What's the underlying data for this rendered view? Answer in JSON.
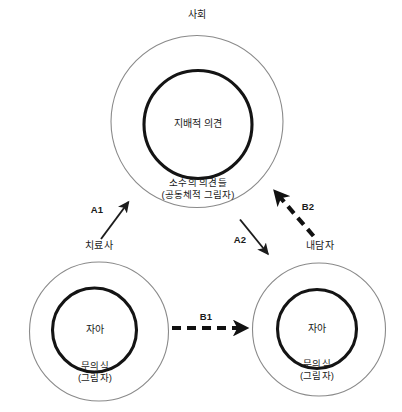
{
  "diagram": {
    "title_visible": false,
    "colors": {
      "background": "#ffffff",
      "outer_circle_stroke": "#8a8a8a",
      "inner_circle_stroke": "#141414",
      "arrow_stroke": "#1a1a1a",
      "text": "#1a1a1a"
    },
    "nodes": [
      {
        "id": "society",
        "external_label": "사회",
        "inner_label": "지배적 의견",
        "ring_label_line1": "소수의 의견들",
        "ring_label_line2": "(공동체적 그림자)"
      },
      {
        "id": "therapist",
        "external_label": "치료사",
        "inner_label": "자아",
        "ring_label_line1": "무의식",
        "ring_label_line2": "(그림자)"
      },
      {
        "id": "client",
        "external_label": "내담자",
        "inner_label": "자아",
        "ring_label_line1": "무의식",
        "ring_label_line2": "(그림자)"
      }
    ],
    "arrows": [
      {
        "id": "a1",
        "label": "A1",
        "style": "solid-thin",
        "from": "therapist",
        "to": "society"
      },
      {
        "id": "a2",
        "label": "A2",
        "style": "solid-thin",
        "from": "society",
        "to": "client"
      },
      {
        "id": "b1",
        "label": "B1",
        "style": "dashed-thick",
        "from": "therapist",
        "to": "client"
      },
      {
        "id": "b2",
        "label": "B2",
        "style": "dashed-thick",
        "from": "client",
        "to": "society"
      }
    ]
  }
}
